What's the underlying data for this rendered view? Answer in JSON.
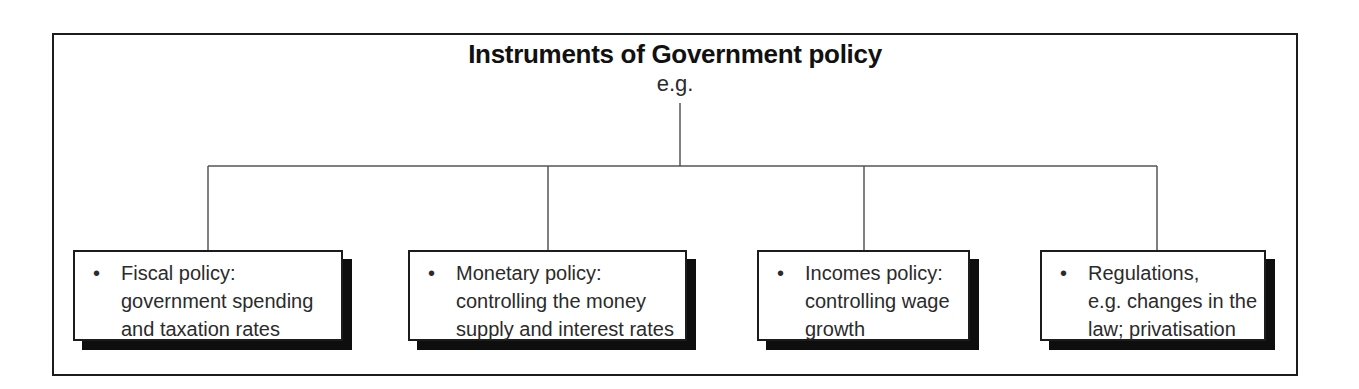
{
  "diagram": {
    "title": "Instruments of Government policy",
    "subtitle": "e.g.",
    "bullet_glyph": "•",
    "colors": {
      "border": "#1c1c1c",
      "text": "#2b2b2b",
      "title_text": "#111111",
      "connector_line": "#555555",
      "box_shadow": "#0e0e0e",
      "background": "#ffffff"
    },
    "boxes": [
      {
        "id": "fiscal-policy",
        "lines": [
          "Fiscal policy:",
          "government spending",
          "and taxation rates"
        ]
      },
      {
        "id": "monetary-policy",
        "lines": [
          "Monetary policy:",
          "controlling the money",
          "supply and interest rates"
        ]
      },
      {
        "id": "incomes-policy",
        "lines": [
          "Incomes policy:",
          "controlling wage",
          "growth"
        ]
      },
      {
        "id": "regulations",
        "lines": [
          "Regulations,",
          "e.g. changes in the",
          "law; privatisation"
        ]
      }
    ]
  }
}
